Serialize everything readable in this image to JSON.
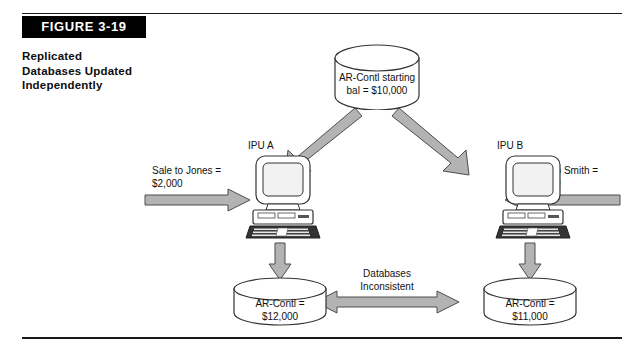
{
  "figure": {
    "number_label": "FIGURE 3-19",
    "caption_lines": [
      "Replicated",
      "Databases Updated",
      "Independently"
    ]
  },
  "diagram": {
    "top_database": {
      "line1": "AR-Contl starting",
      "line2": "bal = $10,000"
    },
    "nodes": [
      {
        "label": "IPU A"
      },
      {
        "label": "IPU B"
      }
    ],
    "left_input": {
      "line1": "Sale to Jones =",
      "line2": "$2,000"
    },
    "right_input": {
      "line1": "Sale to Smith =",
      "line2": "$1,000"
    },
    "left_database": {
      "line1": "AR-Contl =",
      "line2": "$12,000"
    },
    "right_database": {
      "line1": "AR-Contl =",
      "line2": "$11,000"
    },
    "middle_note": {
      "line1": "Databases",
      "line2": "Inconsistent"
    }
  },
  "colors": {
    "ink": "#111111",
    "bar_background": "#000000",
    "bar_text": "#ffffff",
    "arrow_fill": "#b3b3b3",
    "arrow_stroke": "#4d4d4d",
    "shape_stroke": "#333333",
    "shape_fill": "#ffffff",
    "screen_fill": "#f2f2f2",
    "keyboard_fill": "#333333"
  }
}
